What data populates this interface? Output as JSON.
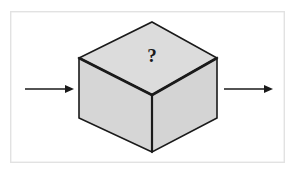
{
  "figure": {
    "name": "black-box-process-diagram",
    "frame": {
      "x": 10,
      "y": 11,
      "width": 275,
      "height": 152,
      "stroke_color": "#e2e2e2",
      "fill_color": "#ffffff",
      "stroke_width": 1.4
    },
    "background_color": "#ffffff",
    "cube": {
      "label": "?",
      "fill_top": "#dcdcdc",
      "fill_left": "#d6d6d6",
      "fill_right": "#d4d4d4",
      "edge_color": "#1a1a1a",
      "edge_width": 1.6,
      "inner_edge_width": 2.6,
      "vertices": {
        "top_apex": [
          152,
          22
        ],
        "top_left": [
          79,
          58
        ],
        "top_right": [
          217,
          58
        ],
        "center_front": [
          152,
          95
        ],
        "bottom_left": [
          79,
          118
        ],
        "bottom_right": [
          217,
          118
        ],
        "bottom_front": [
          152,
          152
        ]
      },
      "question_mark_position": [
        152,
        62
      ]
    },
    "arrows": [
      {
        "name": "input-arrow",
        "direction": "right",
        "x_start": 25,
        "x_end": 74,
        "y": 89,
        "color": "#1a1a1a",
        "line_width": 1.5,
        "head_length": 9,
        "head_width": 8
      },
      {
        "name": "output-arrow",
        "direction": "right",
        "x_start": 224,
        "x_end": 273,
        "y": 89,
        "color": "#1a1a1a",
        "line_width": 1.5,
        "head_length": 9,
        "head_width": 8
      }
    ]
  }
}
